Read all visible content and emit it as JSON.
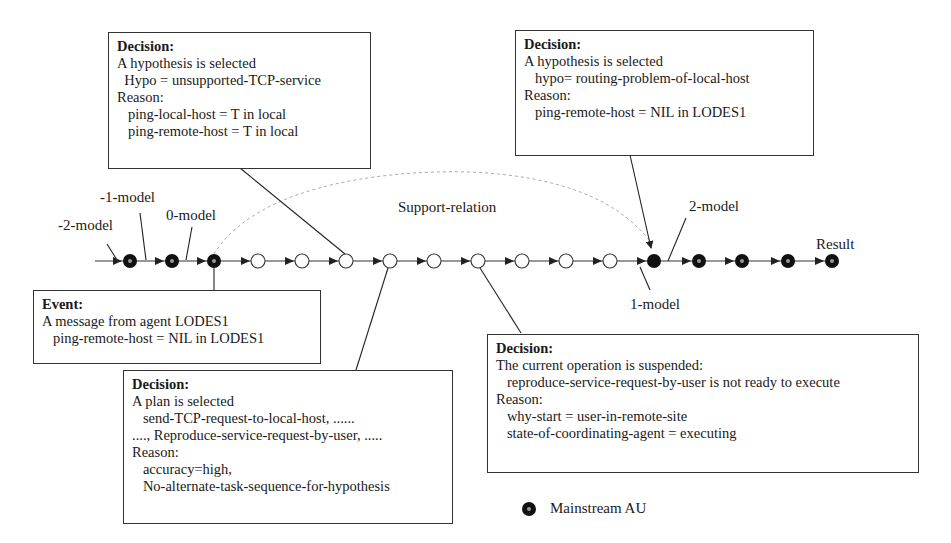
{
  "diagram": {
    "main_line": {
      "y": 261,
      "x_start": 95,
      "x_end": 832
    },
    "nodes": [
      {
        "x": 130,
        "type": "mainstream"
      },
      {
        "x": 172,
        "type": "mainstream"
      },
      {
        "x": 214,
        "type": "mainstream"
      },
      {
        "x": 258,
        "type": "open"
      },
      {
        "x": 302,
        "type": "open"
      },
      {
        "x": 346,
        "type": "open"
      },
      {
        "x": 390,
        "type": "open"
      },
      {
        "x": 434,
        "type": "open"
      },
      {
        "x": 478,
        "type": "open"
      },
      {
        "x": 522,
        "type": "open"
      },
      {
        "x": 566,
        "type": "open"
      },
      {
        "x": 610,
        "type": "open"
      },
      {
        "x": 654,
        "type": "filled"
      },
      {
        "x": 699,
        "type": "mainstream"
      },
      {
        "x": 742,
        "type": "mainstream"
      },
      {
        "x": 788,
        "type": "mainstream"
      },
      {
        "x": 832,
        "type": "mainstream"
      }
    ],
    "model_labels": [
      {
        "text": "-2-model",
        "x": 60,
        "y": 218
      },
      {
        "text": "-1-model",
        "x": 102,
        "y": 190
      },
      {
        "text": "0-model",
        "x": 166,
        "y": 208
      },
      {
        "text": "1-model",
        "x": 628,
        "y": 300
      },
      {
        "text": "2-model",
        "x": 690,
        "y": 210
      },
      {
        "text": "Result",
        "x": 817,
        "y": 236
      }
    ],
    "support_relation": {
      "label": "Support-relation",
      "x": 398,
      "y": 200
    },
    "boxes": {
      "decision_hypo_tcp": {
        "title": "Decision:",
        "lines": [
          "A hypothesis is selected",
          "  Hypo = unsupported-TCP-service",
          "Reason:",
          "   ping-local-host = T in local",
          "   ping-remote-host = T in local"
        ]
      },
      "decision_hypo_routing": {
        "title": "Decision:",
        "lines": [
          "A hypothesis is selected",
          "   hypo= routing-problem-of-local-host",
          "Reason:",
          "   ping-remote-host = NIL in LODES1"
        ]
      },
      "event_message": {
        "title": "Event:",
        "lines": [
          "A message from agent LODES1",
          "   ping-remote-host = NIL in LODES1"
        ]
      },
      "decision_plan": {
        "title": "Decision:",
        "lines": [
          "A plan is selected",
          "   send-TCP-request-to-local-host, ......",
          "...., Reproduce-service-request-by-user, .....",
          "Reason:",
          "   accuracy=high,",
          "   No-alternate-task-sequence-for-hypothesis"
        ]
      },
      "decision_suspend": {
        "title": "Decision:",
        "lines": [
          "The current operation is suspended:",
          "   reproduce-service-request-by-user is not ready to execute",
          "Reason:",
          "   why-start = user-in-remote-site",
          "   state-of-coordinating-agent = executing"
        ]
      }
    },
    "legend": {
      "label": "Mainstream AU",
      "icon": "mainstream-au-dot-icon"
    }
  }
}
